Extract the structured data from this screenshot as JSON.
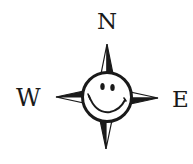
{
  "compass": {
    "labels": {
      "north": "N",
      "west": "W",
      "east": "E"
    },
    "center_face": "smiley-face",
    "colors": {
      "ink": "#1a1a1a",
      "background": "#ffffff"
    }
  }
}
